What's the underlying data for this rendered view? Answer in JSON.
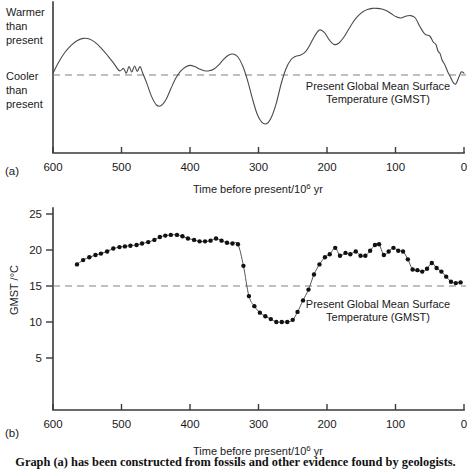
{
  "figure": {
    "caption": "Graph (a) has been constructed from fossils and other evidence found by geologists.",
    "panel_a_label": "(a)",
    "panel_b_label": "(b)"
  },
  "chart_data": [
    {
      "id": "panel-a",
      "type": "line",
      "title": "",
      "xlabel": "Time before present/10⁶ yr",
      "ylabel": "",
      "y_axis_category_labels": [
        "Warmer than present",
        "Cooler than present"
      ],
      "y_label_top_lines": [
        "Warmer",
        "than",
        "present"
      ],
      "y_label_bottom_lines": [
        "Cooler",
        "than",
        "present"
      ],
      "xlim": [
        600,
        0
      ],
      "x_reversed": true,
      "xticks": [
        600,
        500,
        400,
        300,
        200,
        100,
        0
      ],
      "xticklabels": [
        "600",
        "500",
        "400",
        "300",
        "200",
        "100",
        "0"
      ],
      "grid": false,
      "legend": "none",
      "reference_line": {
        "label_lines": [
          "Present Global Mean Surface",
          "Temperature (GMST)"
        ],
        "style": "dashed",
        "value_description": "Present Global Mean Surface Temperature (GMST)"
      },
      "units_note": "Relative temperature, qualitative scale (no numeric y ticks)",
      "x": [
        600,
        592,
        583,
        574,
        565,
        556,
        547,
        538,
        529,
        520,
        511,
        503,
        497,
        493,
        489,
        485,
        481,
        477,
        473,
        469,
        463,
        456,
        449,
        442,
        435,
        428,
        421,
        414,
        407,
        400,
        393,
        386,
        379,
        372,
        365,
        358,
        351,
        344,
        337,
        330,
        323,
        316,
        309,
        302,
        295,
        288,
        281,
        274,
        267,
        260,
        253,
        246,
        239,
        232,
        225,
        218,
        211,
        204,
        197,
        190,
        183,
        176,
        169,
        162,
        155,
        148,
        141,
        134,
        127,
        120,
        113,
        106,
        99,
        92,
        85,
        78,
        71,
        64,
        57,
        50,
        45,
        41,
        38,
        35,
        32,
        28,
        24,
        20,
        16,
        12,
        8,
        4,
        0
      ],
      "y": [
        0.06,
        0.42,
        0.74,
        0.98,
        1.14,
        1.22,
        1.2,
        1.08,
        0.88,
        0.64,
        0.38,
        0.14,
        0.22,
        0.06,
        0.28,
        0.1,
        0.3,
        0.12,
        0.28,
        0.06,
        -0.28,
        -0.72,
        -1.0,
        -1.02,
        -0.82,
        -0.46,
        -0.12,
        0.12,
        0.26,
        0.32,
        0.28,
        0.2,
        0.14,
        0.14,
        0.2,
        0.34,
        0.52,
        0.66,
        0.7,
        0.6,
        0.3,
        -0.18,
        -0.78,
        -1.3,
        -1.58,
        -1.62,
        -1.4,
        -0.94,
        -0.3,
        0.2,
        0.5,
        0.62,
        0.66,
        0.76,
        1.0,
        1.3,
        1.5,
        1.42,
        1.18,
        1.02,
        1.06,
        1.24,
        1.5,
        1.76,
        1.96,
        2.1,
        2.18,
        2.22,
        2.22,
        2.2,
        2.14,
        2.04,
        1.94,
        1.9,
        1.96,
        1.98,
        1.9,
        1.6,
        1.36,
        1.3,
        1.1,
        1.02,
        0.8,
        0.72,
        0.5,
        0.34,
        0.12,
        -0.06,
        -0.24,
        -0.3,
        -0.1,
        0.1,
        0.06
      ]
    },
    {
      "id": "panel-b",
      "type": "line",
      "title": "",
      "xlabel": "Time before present/10⁶ yr",
      "ylabel": "GMST /°C",
      "xlim": [
        600,
        0
      ],
      "x_reversed": true,
      "ylim": [
        0,
        25
      ],
      "xticks": [
        600,
        500,
        400,
        300,
        200,
        100,
        0
      ],
      "xticklabels": [
        "600",
        "500",
        "400",
        "300",
        "200",
        "100",
        "0"
      ],
      "yticks": [
        5,
        10,
        15,
        20,
        25
      ],
      "yticklabels": [
        "5",
        "10",
        "15",
        "20",
        "25"
      ],
      "grid": false,
      "legend": "none",
      "markers": "filled-circle",
      "reference_line": {
        "value": 15,
        "style": "dashed",
        "label_lines": [
          "Present Global Mean Surface",
          "Temperature (GMST)"
        ],
        "value_description": "Present Global Mean Surface Temperature (GMST) = 15 °C"
      },
      "points": [
        [
          565,
          18.0
        ],
        [
          556,
          18.6
        ],
        [
          547,
          19.0
        ],
        [
          538,
          19.3
        ],
        [
          530,
          19.5
        ],
        [
          521,
          19.8
        ],
        [
          512,
          20.2
        ],
        [
          503,
          20.4
        ],
        [
          495,
          20.5
        ],
        [
          487,
          20.6
        ],
        [
          478,
          20.7
        ],
        [
          470,
          20.9
        ],
        [
          461,
          21.1
        ],
        [
          452,
          21.4
        ],
        [
          444,
          21.8
        ],
        [
          436,
          22.0
        ],
        [
          428,
          22.1
        ],
        [
          419,
          22.1
        ],
        [
          411,
          21.9
        ],
        [
          403,
          21.6
        ],
        [
          394,
          21.4
        ],
        [
          386,
          21.2
        ],
        [
          378,
          21.2
        ],
        [
          370,
          21.3
        ],
        [
          362,
          21.6
        ],
        [
          354,
          21.3
        ],
        [
          346,
          21.0
        ],
        [
          338,
          20.9
        ],
        [
          330,
          20.8
        ],
        [
          322,
          17.8
        ],
        [
          314,
          13.6
        ],
        [
          306,
          12.2
        ],
        [
          298,
          11.3
        ],
        [
          290,
          10.8
        ],
        [
          282,
          10.4
        ],
        [
          274,
          10.0
        ],
        [
          266,
          10.0
        ],
        [
          258,
          10.0
        ],
        [
          250,
          10.3
        ],
        [
          243,
          11.4
        ],
        [
          235,
          13.0
        ],
        [
          227,
          14.5
        ],
        [
          219,
          16.6
        ],
        [
          211,
          18.0
        ],
        [
          203,
          19.0
        ],
        [
          196,
          19.4
        ],
        [
          188,
          20.3
        ],
        [
          181,
          19.2
        ],
        [
          173,
          19.6
        ],
        [
          166,
          19.4
        ],
        [
          158,
          19.8
        ],
        [
          151,
          19.2
        ],
        [
          144,
          19.2
        ],
        [
          137,
          19.9
        ],
        [
          130,
          20.7
        ],
        [
          124,
          20.8
        ],
        [
          117,
          19.3
        ],
        [
          110,
          19.8
        ],
        [
          103,
          20.3
        ],
        [
          96,
          19.9
        ],
        [
          89,
          19.8
        ],
        [
          82,
          18.7
        ],
        [
          75,
          17.3
        ],
        [
          68,
          17.2
        ],
        [
          61,
          17.0
        ],
        [
          54,
          17.4
        ],
        [
          47,
          18.2
        ],
        [
          40,
          17.5
        ],
        [
          33,
          17.0
        ],
        [
          26,
          16.3
        ],
        [
          19,
          15.6
        ],
        [
          12,
          15.4
        ],
        [
          5,
          15.5
        ]
      ]
    }
  ]
}
